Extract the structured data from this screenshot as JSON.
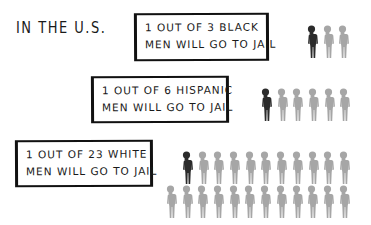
{
  "heading": "IN THE U.S.",
  "colors": {
    "highlight": "#2b2b2b",
    "other": "#a6a6a6"
  },
  "stats": [
    {
      "group": "black",
      "line1": "1 OUT OF 3 BLACK",
      "line2": "MEN WILL GO TO JAIL",
      "ratio_of": 3,
      "box": {
        "left": 134,
        "top": 13,
        "width": 135,
        "height": 48
      },
      "rows": [
        {
          "left": 305,
          "top": 25,
          "count": 3,
          "highlight_index": 0
        }
      ]
    },
    {
      "group": "hispanic",
      "line1": "1 OUT OF 6 HISPANIC",
      "line2": "MEN WILL GO TO JAIL",
      "ratio_of": 6,
      "box": {
        "left": 91,
        "top": 76,
        "width": 138,
        "height": 47
      },
      "rows": [
        {
          "left": 259,
          "top": 88,
          "count": 6,
          "highlight_index": 0
        }
      ]
    },
    {
      "group": "white",
      "line1": "1 OUT OF 23 WHITE",
      "line2": "MEN WILL GO TO JAIL",
      "ratio_of": 23,
      "box": {
        "left": 15,
        "top": 140,
        "width": 138,
        "height": 47
      },
      "rows": [
        {
          "left": 180,
          "top": 151,
          "count": 11,
          "highlight_index": 0
        },
        {
          "left": 164,
          "top": 185,
          "count": 12,
          "highlight_index": -1
        }
      ]
    }
  ]
}
